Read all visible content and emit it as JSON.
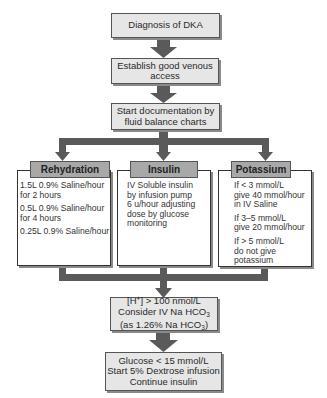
{
  "diagram": {
    "steps": [
      {
        "id": "diagnosis",
        "text": "Diagnosis of DKA"
      },
      {
        "id": "venous-access",
        "line1": "Establish good venous",
        "line2": "access"
      },
      {
        "id": "documentation",
        "line1": "Start documentation by",
        "line2": "fluid balance charts"
      }
    ],
    "branches": [
      {
        "title": "Rehydration",
        "items": [
          {
            "line1": "1.5L 0.9% Saline/hour",
            "line2": "for 2 hours"
          },
          {
            "line1": "0.5L 0.9% Saline/hour",
            "line2": "for 4 hours"
          },
          {
            "line1": "0.25L 0.9% Saline/hour"
          }
        ]
      },
      {
        "title": "Insulin",
        "items": [
          {
            "line1": "IV Soluble insulin",
            "line2": "by infusion pump",
            "line3": "6 u/hour adjusting",
            "line4": "dose by glucose",
            "line5": "monitoring"
          }
        ]
      },
      {
        "title": "Potassium",
        "items": [
          {
            "line1": "If < 3 mmol/L",
            "line2": "give 40 mmol/hour",
            "line3": "in IV Saline"
          },
          {
            "line1": "If 3–5 mmol/L",
            "line2": "give 20 mmol/hour"
          },
          {
            "line1": "If > 5 mmol/L",
            "line2": "do not give",
            "line3": "potassium"
          }
        ]
      }
    ],
    "bicarbonate": {
      "h_prefix": "[H",
      "h_sup": "+",
      "h_suffix": "] > 100 nmol/L",
      "line2_prefix": "Consider IV Na HCO",
      "line2_sub": "3",
      "line3_prefix": "(as 1.26% Na HCO",
      "line3_sub": "3",
      "line3_suffix": ")"
    },
    "glucose": {
      "line1": "Glucose < 15 mmol/L",
      "line2": "Start 5% Dextrose infusion",
      "line3": "Continue insulin"
    }
  },
  "colors": {
    "box_fill": "#e6e6e6",
    "header_fill": "#a8a8a8",
    "arrow": "#5a5a5a"
  }
}
